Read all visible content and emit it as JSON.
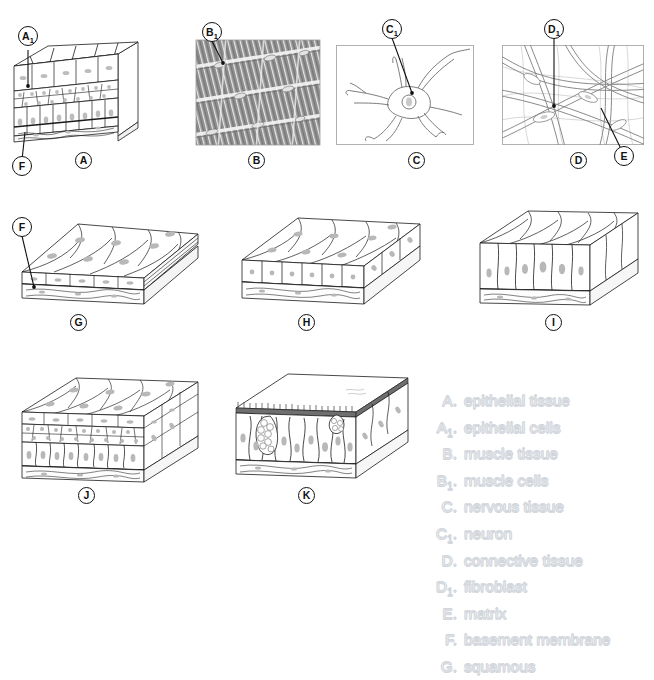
{
  "figure": {
    "kind": "tissue-types-plate",
    "background": "#ffffff",
    "ink": "#111111",
    "muscle_gray": "#8e8e8e",
    "ghost_stroke": "#d4d8de"
  },
  "top_strip": {
    "text": ""
  },
  "panels": [
    {
      "id": "A",
      "caption": "A",
      "kind": "block-stratified-epithelium",
      "x": 10,
      "y": 36,
      "w": 130,
      "h": 106,
      "caption_x": 75,
      "caption_y": 152
    },
    {
      "id": "B",
      "caption": "B",
      "kind": "muscle-micrograph",
      "x": 196,
      "y": 40,
      "w": 124,
      "h": 105,
      "caption_x": 248,
      "caption_y": 152
    },
    {
      "id": "C",
      "caption": "C",
      "kind": "neuron",
      "x": 336,
      "y": 45,
      "w": 136,
      "h": 100,
      "caption_x": 408,
      "caption_y": 152
    },
    {
      "id": "D",
      "caption": "D",
      "kind": "connective-fibers",
      "x": 502,
      "y": 45,
      "w": 140,
      "h": 100,
      "caption_x": 570,
      "caption_y": 152
    },
    {
      "id": "G",
      "caption": "G",
      "kind": "block-squamous",
      "x": 8,
      "y": 212,
      "w": 196,
      "h": 92,
      "caption_x": 70,
      "caption_y": 314
    },
    {
      "id": "H",
      "caption": "H",
      "kind": "block-cuboidal",
      "x": 232,
      "y": 210,
      "w": 196,
      "h": 96,
      "caption_x": 298,
      "caption_y": 314
    },
    {
      "id": "I",
      "caption": "I",
      "kind": "block-columnar",
      "x": 474,
      "y": 205,
      "w": 172,
      "h": 105,
      "caption_x": 545,
      "caption_y": 314
    },
    {
      "id": "J",
      "caption": "J",
      "kind": "block-stratified",
      "x": 14,
      "y": 372,
      "w": 196,
      "h": 108,
      "caption_x": 78,
      "caption_y": 487
    },
    {
      "id": "K",
      "caption": "K",
      "kind": "block-pseudostratified-ciliated",
      "x": 228,
      "y": 368,
      "w": 192,
      "h": 112,
      "caption_x": 298,
      "caption_y": 487
    }
  ],
  "callouts": [
    {
      "id": "A1",
      "letter": "A",
      "sub": "1",
      "cx": 18,
      "cy": 30,
      "tip_x": 22,
      "tip_y": 90
    },
    {
      "id": "F-A",
      "letter": "F",
      "sub": "",
      "cx": 18,
      "cy": 160,
      "tip_x": 24,
      "tip_y": 131
    },
    {
      "id": "B1",
      "letter": "B",
      "sub": "1",
      "cx": 205,
      "cy": 31,
      "tip_x": 221,
      "tip_y": 63
    },
    {
      "id": "C1",
      "letter": "C",
      "sub": "1",
      "cx": 389,
      "cy": 28,
      "tip_x": 411,
      "tip_y": 93
    },
    {
      "id": "D1",
      "letter": "D",
      "sub": "1",
      "cx": 546,
      "cy": 28,
      "tip_x": 551,
      "tip_y": 106
    },
    {
      "id": "E",
      "letter": "E",
      "sub": "",
      "cx": 622,
      "cy": 155,
      "tip_x": 600,
      "tip_y": 108
    },
    {
      "id": "F-G",
      "letter": "F",
      "sub": "",
      "cx": 12,
      "cy": 226,
      "tip_x": 31,
      "tip_y": 285
    }
  ],
  "legend": {
    "entries": [
      {
        "key": "A.",
        "key_letter": "A",
        "key_sub": "",
        "term": "epithelial tissue"
      },
      {
        "key": "A1.",
        "key_letter": "A",
        "key_sub": "1",
        "term": "epithelial cells"
      },
      {
        "key": "B.",
        "key_letter": "B",
        "key_sub": "",
        "term": "muscle tissue"
      },
      {
        "key": "B1.",
        "key_letter": "B",
        "key_sub": "1",
        "term": "muscle cells"
      },
      {
        "key": "C.",
        "key_letter": "C",
        "key_sub": "",
        "term": "nervous tissue"
      },
      {
        "key": "C1.",
        "key_letter": "C",
        "key_sub": "1",
        "term": "neuron"
      },
      {
        "key": "D.",
        "key_letter": "D",
        "key_sub": "",
        "term": "connective tissue"
      },
      {
        "key": "D1.",
        "key_letter": "D",
        "key_sub": "1",
        "term": "fibroblast"
      },
      {
        "key": "E.",
        "key_letter": "E",
        "key_sub": "",
        "term": "matrix"
      },
      {
        "key": "F.",
        "key_letter": "F",
        "key_sub": "",
        "term": "basement membrane"
      },
      {
        "key": "G.",
        "key_letter": "G",
        "key_sub": "",
        "term": "squamous"
      }
    ]
  }
}
